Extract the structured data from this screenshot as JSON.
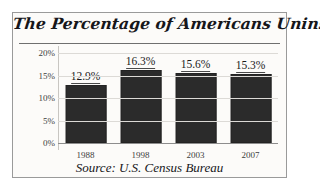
{
  "chart_data": {
    "type": "bar",
    "title": "The Percentage of Americans Uninsured",
    "xlabel": "",
    "ylabel": "",
    "categories": [
      "1988",
      "1998",
      "2003",
      "2007"
    ],
    "values": [
      12.9,
      16.3,
      15.6,
      15.3
    ],
    "value_labels": [
      "12.9%",
      "16.3%",
      "15.6%",
      "15.3%"
    ],
    "ylim": [
      0,
      20
    ],
    "yticks": [
      20,
      15,
      10,
      5,
      0
    ],
    "ytick_labels": [
      "20%",
      "15%",
      "10%",
      "5%",
      "0%"
    ],
    "grid": true,
    "legend": false,
    "source": "Source: U.S. Census Bureau",
    "bar_color": "#2b2b2b",
    "background_color": "#fcfbf9",
    "frame_color": "#9a9a9a",
    "gridline_color": "#dcdad6"
  }
}
